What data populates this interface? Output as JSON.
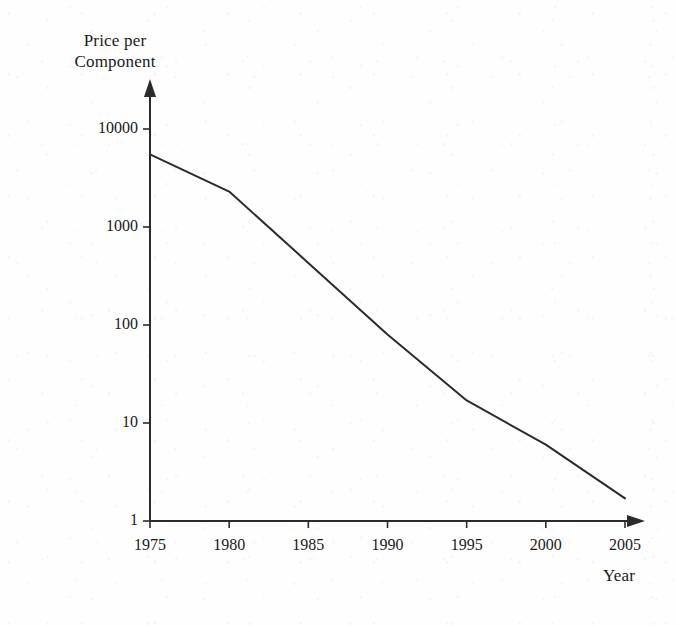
{
  "figure": {
    "background_color": "#fefefe",
    "ink_color": "#2b2b2b"
  },
  "chart_data": {
    "type": "line",
    "title": "",
    "subtitle": "",
    "xlabel": "Year",
    "ylabel": "Price per Component",
    "ylabel_line1": "Price per",
    "ylabel_line2": "Component",
    "yscale": "log",
    "xscale": "linear",
    "xlim": [
      1974,
      2006
    ],
    "ylim": [
      1,
      10000
    ],
    "grid": false,
    "legend": false,
    "legend_position": "none",
    "x_ticks": [
      1975,
      1980,
      1985,
      1990,
      1995,
      2000,
      2005
    ],
    "x_tick_labels": [
      "1975",
      "1980",
      "1985",
      "1990",
      "1995",
      "2000",
      "2005"
    ],
    "y_ticks": [
      1,
      10,
      100,
      1000,
      10000
    ],
    "y_tick_labels": [
      "1",
      "10",
      "100",
      "1000",
      "10000"
    ],
    "series": [
      {
        "name": "Price per Component",
        "color": "#2b2b2b",
        "line_width": 2,
        "x": [
          1975,
          1980,
          1985,
          1990,
          1995,
          2000,
          2005
        ],
        "values": [
          5500,
          2300,
          430,
          80,
          17,
          6,
          1.7
        ]
      }
    ],
    "annotations": []
  },
  "axes": {
    "x_axis_arrow": "right-arrow",
    "y_axis_arrow": "up-arrow"
  }
}
